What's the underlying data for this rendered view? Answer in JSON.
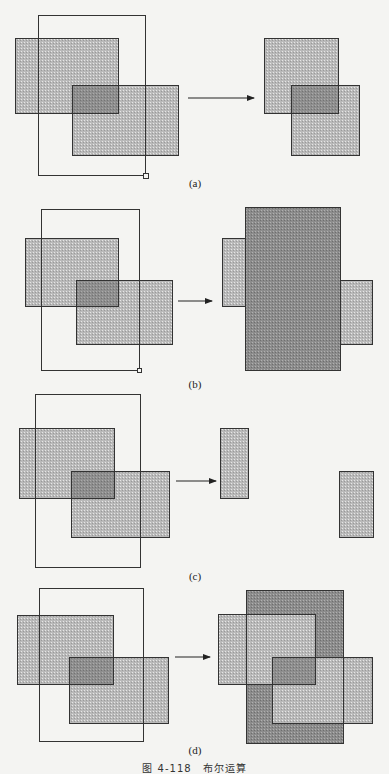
{
  "figure": {
    "caption": "图 4-118　布尔运算",
    "colors": {
      "background": "#f4f4f2",
      "light_fill": "#b9b9b9",
      "overlap_fill": "#8e8e8e",
      "dark_fill": "#8c8c8c",
      "stroke": "#333333"
    },
    "panels": [
      {
        "id": "a",
        "label": "(a)",
        "label_pos": [
          165,
          177
        ],
        "arrow": {
          "x1": 188,
          "x2": 254,
          "y": 98
        },
        "left": {
          "outline": [
            38,
            15,
            107,
            160
          ],
          "handle": [
            143,
            173,
            5,
            5
          ],
          "rect1": [
            15,
            38,
            103,
            75
          ],
          "rect2": [
            72,
            85,
            106,
            70
          ],
          "overlap": [
            72,
            85,
            46,
            28
          ]
        },
        "right": {
          "shapes": [
            {
              "name": "rect1",
              "box": [
                264,
                38,
                74,
                75
              ],
              "fill": "light"
            },
            {
              "name": "rect2",
              "box": [
                291,
                85,
                68,
                70
              ],
              "fill": "light"
            },
            {
              "name": "overlap",
              "box": [
                291,
                85,
                47,
                28
              ],
              "fill": "overlap"
            }
          ]
        }
      },
      {
        "id": "b",
        "label": "(b)",
        "label_pos": [
          165,
          378
        ],
        "arrow": {
          "x1": 178,
          "x2": 212,
          "y": 301
        },
        "left": {
          "outline": [
            41,
            209,
            98,
            161
          ],
          "handle": [
            137,
            368,
            4,
            4
          ],
          "rect1": [
            25,
            238,
            93,
            68
          ],
          "rect2": [
            76,
            280,
            96,
            64
          ],
          "overlap": [
            76,
            280,
            42,
            26
          ]
        },
        "right": {
          "shapes": [
            {
              "name": "left-strip",
              "box": [
                222,
                238,
                23,
                68
              ],
              "fill": "light"
            },
            {
              "name": "right-strip",
              "box": [
                340,
                280,
                32,
                64
              ],
              "fill": "light"
            },
            {
              "name": "union-block",
              "box": [
                245,
                207,
                95,
                163
              ],
              "fill": "dark"
            }
          ]
        }
      },
      {
        "id": "c",
        "label": "(c)",
        "label_pos": [
          165,
          570
        ],
        "arrow": {
          "x1": 176,
          "x2": 216,
          "y": 481
        },
        "left": {
          "outline": [
            35,
            394,
            105,
            173
          ],
          "handle": null,
          "rect1": [
            19,
            428,
            95,
            70
          ],
          "rect2": [
            71,
            471,
            98,
            66
          ],
          "overlap": [
            71,
            471,
            43,
            27
          ]
        },
        "right": {
          "shapes": [
            {
              "name": "left-strip",
              "box": [
                220,
                428,
                28,
                70
              ],
              "fill": "light"
            },
            {
              "name": "right-strip",
              "box": [
                339,
                471,
                34,
                66
              ],
              "fill": "light"
            }
          ]
        }
      },
      {
        "id": "d",
        "label": "(d)",
        "label_pos": [
          165,
          744
        ],
        "arrow": {
          "x1": 175,
          "x2": 210,
          "y": 657
        },
        "left": {
          "outline": [
            39,
            588,
            104,
            153
          ],
          "handle": null,
          "rect1": [
            17,
            615,
            96,
            69
          ],
          "rect2": [
            69,
            657,
            99,
            66
          ],
          "overlap": [
            69,
            657,
            44,
            27
          ]
        },
        "right": {
          "shapes": [
            {
              "name": "dark-block",
              "box": [
                246,
                590,
                97,
                153
              ],
              "fill": "dark"
            },
            {
              "name": "rect1-outside",
              "box": [
                218,
                614,
                28,
                70
              ],
              "fill": "light"
            },
            {
              "name": "rect1-inside",
              "box": [
                246,
                614,
                69,
                70
              ],
              "fill": "light"
            },
            {
              "name": "rect2-inside",
              "box": [
                272,
                657,
                71,
                66
              ],
              "fill": "light"
            },
            {
              "name": "rect2-outside",
              "box": [
                343,
                657,
                29,
                66
              ],
              "fill": "light"
            },
            {
              "name": "rect-overlap",
              "box": [
                272,
                657,
                43,
                27
              ],
              "fill": "overlap"
            }
          ],
          "strokes": [
            [
              246,
              590,
              97,
              153
            ],
            [
              218,
              614,
              97,
              70
            ],
            [
              272,
              657,
              100,
              66
            ]
          ]
        }
      }
    ]
  }
}
